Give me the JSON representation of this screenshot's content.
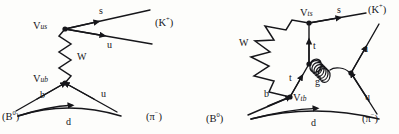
{
  "figure": {
    "type": "feynman-diagram-pair",
    "background_color": "#fdfdfb",
    "line_color": "#16161a"
  },
  "left_diagram": {
    "name": "tree-diagram",
    "vertices": [
      {
        "label_v": "V",
        "label_sub": "us"
      },
      {
        "label_v": "V",
        "label_sub": "ub"
      }
    ],
    "vertex_us": "V",
    "vertex_us_sub": "us",
    "vertex_ub": "V",
    "vertex_ub_sub": "ub",
    "boson": "W",
    "quark_s": "s",
    "quark_u_top": "u",
    "quark_b": "b",
    "quark_u_bottom": "u",
    "quark_d": "d",
    "initial_state": "B",
    "initial_state_charge": "0",
    "final_state_kaon": "K",
    "final_state_kaon_charge": "+",
    "final_state_pion": "π",
    "final_state_pion_charge": "−"
  },
  "right_diagram": {
    "name": "penguin-diagram",
    "vertex_ts": "V",
    "vertex_ts_sub": "ts",
    "vertex_tb": "V",
    "vertex_tb_sub": "tb",
    "boson_w": "W",
    "boson_g": "g",
    "quark_t_upper": "t",
    "quark_t_lower": "t",
    "quark_s": "s",
    "quark_b": "b",
    "quark_u_upper": "u",
    "quark_u_lower": "u",
    "quark_d": "d",
    "initial_state": "B",
    "initial_state_charge": "0",
    "final_state_kaon": "K",
    "final_state_kaon_charge": "+",
    "final_state_pion": "π",
    "final_state_pion_charge": "−"
  }
}
